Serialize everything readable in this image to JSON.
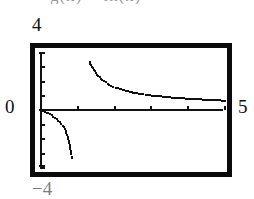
{
  "figure": {
    "caption_cropped": "g(x) = ln(x)",
    "labels": {
      "y_max": "4",
      "y_min": "−4",
      "y_zero": "0",
      "x_max": "5"
    }
  },
  "chart_data": {
    "type": "scatter",
    "title": "g(x) = ln(x)",
    "xlabel": "",
    "ylabel": "",
    "xlim": [
      0,
      5
    ],
    "ylim": [
      -4,
      4
    ],
    "grid": false,
    "legend": "none",
    "axis_ticks": {
      "x": [
        1,
        2,
        3,
        4,
        5
      ],
      "y": [
        -4,
        -3,
        -2,
        -1,
        0,
        1,
        2,
        3,
        4
      ]
    },
    "annotations": [
      "vertical asymptote near x = 1.2",
      "horizontal asymptote near y = 0.5"
    ],
    "series": [
      {
        "name": "upper-branch",
        "x": [
          1.32,
          1.36,
          1.41,
          1.46,
          1.52,
          1.59,
          1.67,
          1.76,
          1.86,
          1.97,
          2.09,
          2.22,
          2.36,
          2.51,
          2.67,
          2.84,
          3.02,
          3.21,
          3.41,
          3.62,
          3.84,
          4.07,
          4.31,
          4.56,
          4.82,
          5.0
        ],
        "y": [
          3.35,
          3.15,
          2.95,
          2.72,
          2.5,
          2.3,
          2.12,
          1.95,
          1.8,
          1.66,
          1.54,
          1.43,
          1.33,
          1.25,
          1.17,
          1.1,
          1.04,
          0.99,
          0.94,
          0.89,
          0.85,
          0.81,
          0.78,
          0.74,
          0.71,
          0.68
        ]
      },
      {
        "name": "lower-branch",
        "x": [
          0.0,
          0.06,
          0.12,
          0.2,
          0.29,
          0.38,
          0.47,
          0.55,
          0.62,
          0.67,
          0.71,
          0.74,
          0.77,
          0.79,
          0.81,
          0.82,
          0.83,
          0.84
        ],
        "y": [
          0.0,
          -0.04,
          -0.1,
          -0.2,
          -0.34,
          -0.5,
          -0.7,
          -0.92,
          -1.18,
          -1.45,
          -1.72,
          -2.0,
          -2.28,
          -2.55,
          -2.82,
          -3.05,
          -3.2,
          -3.3
        ]
      }
    ]
  }
}
